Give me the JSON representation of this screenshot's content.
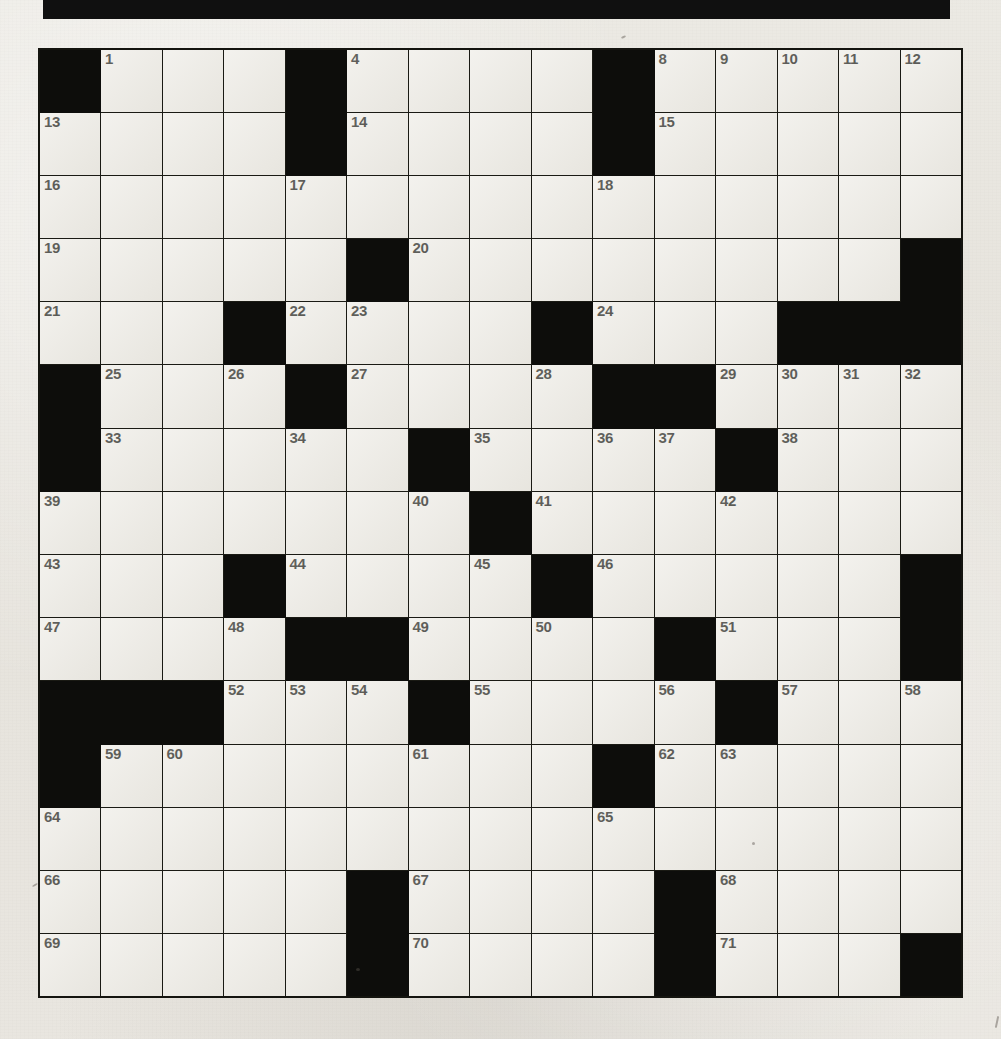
{
  "page": {
    "type": "crossword-puzzle-grid",
    "rows": 15,
    "columns": 15,
    "background_color": "#e8e6e1",
    "cell_fill_color": "#edebe5",
    "block_color": "#0d0d0b",
    "grid_line_color": "#1a1a14",
    "number_color": "#15150f"
  },
  "banner": {
    "name": "top-black-bar",
    "color": "#101010"
  },
  "crossword": {
    "total_clue_numbers": 71,
    "first_number": 1,
    "last_number": 71,
    "grid": [
      [
        {
          "block": true,
          "num": ""
        },
        {
          "block": false,
          "num": "1"
        },
        {
          "block": false,
          "num": ""
        },
        {
          "block": false,
          "num": ""
        },
        {
          "block": true,
          "num": ""
        },
        {
          "block": false,
          "num": "4"
        },
        {
          "block": false,
          "num": ""
        },
        {
          "block": false,
          "num": ""
        },
        {
          "block": false,
          "num": ""
        },
        {
          "block": true,
          "num": ""
        },
        {
          "block": false,
          "num": "8"
        },
        {
          "block": false,
          "num": "9"
        },
        {
          "block": false,
          "num": "10"
        },
        {
          "block": false,
          "num": "11"
        },
        {
          "block": false,
          "num": "12"
        }
      ],
      [
        {
          "block": false,
          "num": "13"
        },
        {
          "block": false,
          "num": ""
        },
        {
          "block": false,
          "num": ""
        },
        {
          "block": false,
          "num": ""
        },
        {
          "block": true,
          "num": ""
        },
        {
          "block": false,
          "num": "14"
        },
        {
          "block": false,
          "num": ""
        },
        {
          "block": false,
          "num": ""
        },
        {
          "block": false,
          "num": ""
        },
        {
          "block": true,
          "num": ""
        },
        {
          "block": false,
          "num": "15"
        },
        {
          "block": false,
          "num": ""
        },
        {
          "block": false,
          "num": ""
        },
        {
          "block": false,
          "num": ""
        },
        {
          "block": false,
          "num": ""
        }
      ],
      [
        {
          "block": false,
          "num": "16"
        },
        {
          "block": false,
          "num": ""
        },
        {
          "block": false,
          "num": ""
        },
        {
          "block": false,
          "num": ""
        },
        {
          "block": false,
          "num": "17"
        },
        {
          "block": false,
          "num": ""
        },
        {
          "block": false,
          "num": ""
        },
        {
          "block": false,
          "num": ""
        },
        {
          "block": false,
          "num": ""
        },
        {
          "block": false,
          "num": "18"
        },
        {
          "block": false,
          "num": ""
        },
        {
          "block": false,
          "num": ""
        },
        {
          "block": false,
          "num": ""
        },
        {
          "block": false,
          "num": ""
        },
        {
          "block": false,
          "num": ""
        }
      ],
      [
        {
          "block": false,
          "num": "19"
        },
        {
          "block": false,
          "num": ""
        },
        {
          "block": false,
          "num": ""
        },
        {
          "block": false,
          "num": ""
        },
        {
          "block": false,
          "num": ""
        },
        {
          "block": true,
          "num": ""
        },
        {
          "block": false,
          "num": "20"
        },
        {
          "block": false,
          "num": ""
        },
        {
          "block": false,
          "num": ""
        },
        {
          "block": false,
          "num": ""
        },
        {
          "block": false,
          "num": ""
        },
        {
          "block": false,
          "num": ""
        },
        {
          "block": false,
          "num": ""
        },
        {
          "block": false,
          "num": ""
        },
        {
          "block": true,
          "num": ""
        }
      ],
      [
        {
          "block": false,
          "num": "21"
        },
        {
          "block": false,
          "num": ""
        },
        {
          "block": false,
          "num": ""
        },
        {
          "block": true,
          "num": ""
        },
        {
          "block": false,
          "num": "22"
        },
        {
          "block": false,
          "num": "23"
        },
        {
          "block": false,
          "num": ""
        },
        {
          "block": false,
          "num": ""
        },
        {
          "block": true,
          "num": ""
        },
        {
          "block": false,
          "num": "24"
        },
        {
          "block": false,
          "num": ""
        },
        {
          "block": false,
          "num": ""
        },
        {
          "block": true,
          "num": ""
        },
        {
          "block": true,
          "num": ""
        },
        {
          "block": true,
          "num": ""
        }
      ],
      [
        {
          "block": true,
          "num": ""
        },
        {
          "block": false,
          "num": "25"
        },
        {
          "block": false,
          "num": ""
        },
        {
          "block": false,
          "num": "26"
        },
        {
          "block": true,
          "num": ""
        },
        {
          "block": false,
          "num": "27"
        },
        {
          "block": false,
          "num": ""
        },
        {
          "block": false,
          "num": ""
        },
        {
          "block": false,
          "num": "28"
        },
        {
          "block": true,
          "num": ""
        },
        {
          "block": true,
          "num": ""
        },
        {
          "block": false,
          "num": "29"
        },
        {
          "block": false,
          "num": "30"
        },
        {
          "block": false,
          "num": "31"
        },
        {
          "block": false,
          "num": "32"
        }
      ],
      [
        {
          "block": true,
          "num": ""
        },
        {
          "block": false,
          "num": "33"
        },
        {
          "block": false,
          "num": ""
        },
        {
          "block": false,
          "num": ""
        },
        {
          "block": false,
          "num": "34"
        },
        {
          "block": false,
          "num": ""
        },
        {
          "block": true,
          "num": ""
        },
        {
          "block": false,
          "num": "35"
        },
        {
          "block": false,
          "num": ""
        },
        {
          "block": false,
          "num": "36"
        },
        {
          "block": false,
          "num": "37"
        },
        {
          "block": true,
          "num": ""
        },
        {
          "block": false,
          "num": "38"
        },
        {
          "block": false,
          "num": ""
        },
        {
          "block": false,
          "num": ""
        }
      ],
      [
        {
          "block": false,
          "num": "39"
        },
        {
          "block": false,
          "num": ""
        },
        {
          "block": false,
          "num": ""
        },
        {
          "block": false,
          "num": ""
        },
        {
          "block": false,
          "num": ""
        },
        {
          "block": false,
          "num": ""
        },
        {
          "block": false,
          "num": "40"
        },
        {
          "block": true,
          "num": ""
        },
        {
          "block": false,
          "num": "41"
        },
        {
          "block": false,
          "num": ""
        },
        {
          "block": false,
          "num": ""
        },
        {
          "block": false,
          "num": "42"
        },
        {
          "block": false,
          "num": ""
        },
        {
          "block": false,
          "num": ""
        },
        {
          "block": false,
          "num": ""
        }
      ],
      [
        {
          "block": false,
          "num": "43"
        },
        {
          "block": false,
          "num": ""
        },
        {
          "block": false,
          "num": ""
        },
        {
          "block": true,
          "num": ""
        },
        {
          "block": false,
          "num": "44"
        },
        {
          "block": false,
          "num": ""
        },
        {
          "block": false,
          "num": ""
        },
        {
          "block": false,
          "num": "45"
        },
        {
          "block": true,
          "num": ""
        },
        {
          "block": false,
          "num": "46"
        },
        {
          "block": false,
          "num": ""
        },
        {
          "block": false,
          "num": ""
        },
        {
          "block": false,
          "num": ""
        },
        {
          "block": false,
          "num": ""
        },
        {
          "block": true,
          "num": ""
        }
      ],
      [
        {
          "block": false,
          "num": "47"
        },
        {
          "block": false,
          "num": ""
        },
        {
          "block": false,
          "num": ""
        },
        {
          "block": false,
          "num": "48"
        },
        {
          "block": true,
          "num": ""
        },
        {
          "block": true,
          "num": ""
        },
        {
          "block": false,
          "num": "49"
        },
        {
          "block": false,
          "num": ""
        },
        {
          "block": false,
          "num": "50"
        },
        {
          "block": false,
          "num": ""
        },
        {
          "block": true,
          "num": ""
        },
        {
          "block": false,
          "num": "51"
        },
        {
          "block": false,
          "num": ""
        },
        {
          "block": false,
          "num": ""
        },
        {
          "block": true,
          "num": ""
        }
      ],
      [
        {
          "block": true,
          "num": ""
        },
        {
          "block": true,
          "num": ""
        },
        {
          "block": true,
          "num": ""
        },
        {
          "block": false,
          "num": "52"
        },
        {
          "block": false,
          "num": "53"
        },
        {
          "block": false,
          "num": "54"
        },
        {
          "block": true,
          "num": ""
        },
        {
          "block": false,
          "num": "55"
        },
        {
          "block": false,
          "num": ""
        },
        {
          "block": false,
          "num": ""
        },
        {
          "block": false,
          "num": "56"
        },
        {
          "block": true,
          "num": ""
        },
        {
          "block": false,
          "num": "57"
        },
        {
          "block": false,
          "num": ""
        },
        {
          "block": false,
          "num": "58"
        }
      ],
      [
        {
          "block": true,
          "num": ""
        },
        {
          "block": false,
          "num": "59"
        },
        {
          "block": false,
          "num": "60"
        },
        {
          "block": false,
          "num": ""
        },
        {
          "block": false,
          "num": ""
        },
        {
          "block": false,
          "num": ""
        },
        {
          "block": false,
          "num": "61"
        },
        {
          "block": false,
          "num": ""
        },
        {
          "block": false,
          "num": ""
        },
        {
          "block": true,
          "num": ""
        },
        {
          "block": false,
          "num": "62"
        },
        {
          "block": false,
          "num": "63"
        },
        {
          "block": false,
          "num": ""
        },
        {
          "block": false,
          "num": ""
        },
        {
          "block": false,
          "num": ""
        }
      ],
      [
        {
          "block": false,
          "num": "64"
        },
        {
          "block": false,
          "num": ""
        },
        {
          "block": false,
          "num": ""
        },
        {
          "block": false,
          "num": ""
        },
        {
          "block": false,
          "num": ""
        },
        {
          "block": false,
          "num": ""
        },
        {
          "block": false,
          "num": ""
        },
        {
          "block": false,
          "num": ""
        },
        {
          "block": false,
          "num": ""
        },
        {
          "block": false,
          "num": "65"
        },
        {
          "block": false,
          "num": ""
        },
        {
          "block": false,
          "num": ""
        },
        {
          "block": false,
          "num": ""
        },
        {
          "block": false,
          "num": ""
        },
        {
          "block": false,
          "num": ""
        }
      ],
      [
        {
          "block": false,
          "num": "66"
        },
        {
          "block": false,
          "num": ""
        },
        {
          "block": false,
          "num": ""
        },
        {
          "block": false,
          "num": ""
        },
        {
          "block": false,
          "num": ""
        },
        {
          "block": true,
          "num": ""
        },
        {
          "block": false,
          "num": "67"
        },
        {
          "block": false,
          "num": ""
        },
        {
          "block": false,
          "num": ""
        },
        {
          "block": false,
          "num": ""
        },
        {
          "block": true,
          "num": ""
        },
        {
          "block": false,
          "num": "68"
        },
        {
          "block": false,
          "num": ""
        },
        {
          "block": false,
          "num": ""
        },
        {
          "block": false,
          "num": ""
        }
      ],
      [
        {
          "block": false,
          "num": "69"
        },
        {
          "block": false,
          "num": ""
        },
        {
          "block": false,
          "num": ""
        },
        {
          "block": false,
          "num": ""
        },
        {
          "block": false,
          "num": ""
        },
        {
          "block": true,
          "num": ""
        },
        {
          "block": false,
          "num": "70"
        },
        {
          "block": false,
          "num": ""
        },
        {
          "block": false,
          "num": ""
        },
        {
          "block": false,
          "num": ""
        },
        {
          "block": true,
          "num": ""
        },
        {
          "block": false,
          "num": "71"
        },
        {
          "block": false,
          "num": ""
        },
        {
          "block": false,
          "num": ""
        },
        {
          "block": true,
          "num": ""
        }
      ]
    ]
  }
}
